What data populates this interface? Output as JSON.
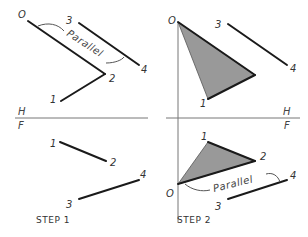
{
  "diagram": {
    "colors": {
      "line": "#1a1a1a",
      "fill": "#999999",
      "fold": "#777777",
      "text": "#333333"
    },
    "fold_line": {
      "top_label": "H",
      "bottom_label": "F"
    },
    "step1": {
      "caption": "STEP 1",
      "top_view": {
        "points": {
          "O": "O",
          "p1": "1",
          "p2": "2",
          "p3": "3",
          "p4": "4"
        },
        "parallel_label": "Parallel"
      },
      "front_view": {
        "points": {
          "p1": "1",
          "p2": "2",
          "p3": "3",
          "p4": "4"
        }
      },
      "fold_top": "H",
      "fold_bottom": "F"
    },
    "step2": {
      "caption": "STEP 2",
      "top_view": {
        "points": {
          "O": "O",
          "p1": "1",
          "p3": "3",
          "p4": "4"
        }
      },
      "front_view": {
        "points": {
          "O": "O",
          "p1": "1",
          "p2": "2",
          "p3": "3",
          "p4": "4"
        },
        "parallel_label": "Parallel"
      },
      "fold_top": "H",
      "fold_bottom": "F"
    }
  }
}
